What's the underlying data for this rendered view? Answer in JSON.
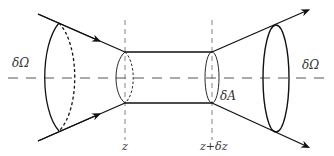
{
  "diagram": {
    "labels": {
      "solid_angle_left": "δΩ",
      "solid_angle_right": "δΩ",
      "area": "δA",
      "z": "z",
      "z_plus_dz": "z+δz"
    },
    "colors": {
      "line": "#111111",
      "dashed": "#555555",
      "text": "#333333",
      "background": "#ffffff"
    }
  }
}
